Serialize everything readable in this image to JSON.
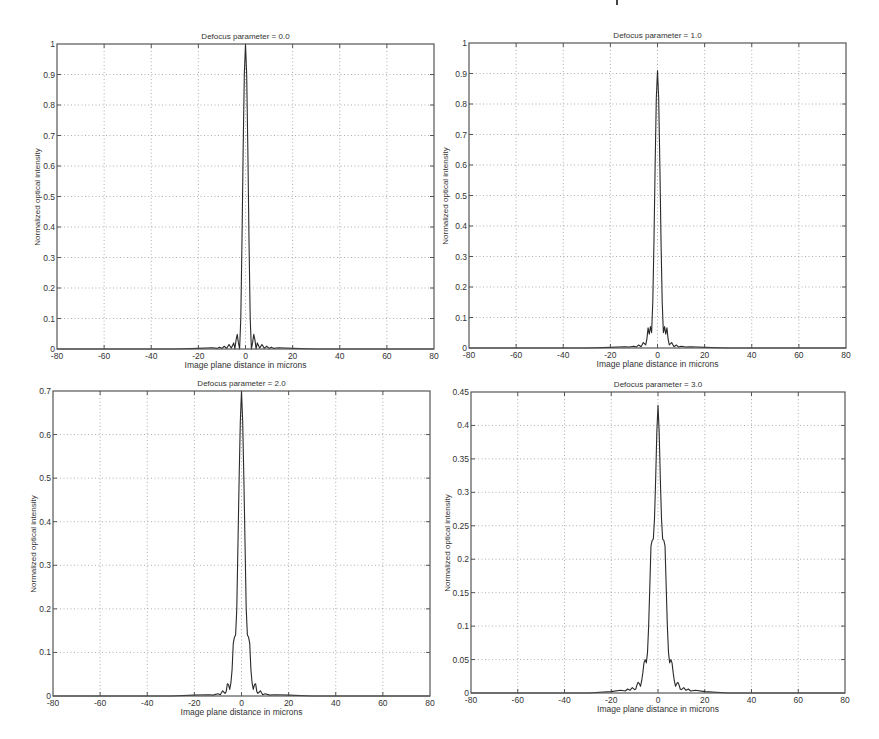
{
  "figure": {
    "background": "#ffffff",
    "line_color": "#2a2a2a",
    "grid_color": "#9a9a9a",
    "axes_color": "#555555"
  },
  "chart_data": [
    {
      "type": "line",
      "title": "Defocus parameter = 0.0",
      "xlabel": "Image plane distance in microns",
      "ylabel": "Normalized optical intensity",
      "xlim": [
        -80,
        80
      ],
      "ylim": [
        0,
        1
      ],
      "xticks": [
        "-80",
        "-60",
        "-40",
        "-20",
        "0",
        "20",
        "40",
        "60",
        "80"
      ],
      "yticks": [
        "0",
        "0.1",
        "0.2",
        "0.3",
        "0.4",
        "0.5",
        "0.6",
        "0.7",
        "0.8",
        "0.9",
        "1"
      ],
      "grid": true,
      "box": {
        "left": 57,
        "top": 44,
        "right": 434,
        "bottom": 349
      },
      "x": [
        -80,
        -30,
        -20,
        -14,
        -12,
        -11,
        -10,
        -9,
        -8,
        -7,
        -6,
        -5,
        -4.5,
        -4,
        -3.5,
        -3,
        -2.5,
        -2,
        -1.5,
        -1,
        -0.5,
        0,
        0.5,
        1,
        1.5,
        2,
        2.5,
        3,
        3.5,
        4,
        4.5,
        5,
        6,
        7,
        8,
        9,
        10,
        11,
        12,
        14,
        20,
        30,
        80
      ],
      "values": [
        0,
        0,
        0.002,
        0.004,
        0.002,
        0.006,
        0.002,
        0.009,
        0.002,
        0.015,
        0.003,
        0.02,
        0.0,
        0.03,
        0.048,
        0.02,
        0.0,
        0.1,
        0.35,
        0.65,
        0.9,
        1.0,
        0.9,
        0.65,
        0.35,
        0.1,
        0.0,
        0.02,
        0.048,
        0.03,
        0.0,
        0.02,
        0.003,
        0.015,
        0.002,
        0.009,
        0.002,
        0.006,
        0.002,
        0.004,
        0.002,
        0,
        0
      ]
    },
    {
      "type": "line",
      "title": "Defocus parameter = 1.0",
      "xlabel": "Image plane distance in microns",
      "ylabel": "Normalized optical intensity",
      "xlim": [
        -80,
        80
      ],
      "ylim": [
        0,
        1
      ],
      "xticks": [
        "-80",
        "-60",
        "-40",
        "-20",
        "0",
        "20",
        "40",
        "60",
        "80"
      ],
      "yticks": [
        "0",
        "0.1",
        "0.2",
        "0.3",
        "0.4",
        "0.5",
        "0.6",
        "0.7",
        "0.8",
        "0.9",
        "1"
      ],
      "grid": true,
      "box": {
        "left": 469,
        "top": 43,
        "right": 846,
        "bottom": 348
      },
      "x": [
        -80,
        -30,
        -20,
        -14,
        -12,
        -10,
        -9,
        -8,
        -7,
        -6,
        -5,
        -4.5,
        -4,
        -3.5,
        -3,
        -2.5,
        -2,
        -1.5,
        -1,
        -0.5,
        0,
        0.5,
        1,
        1.5,
        2,
        2.5,
        3,
        3.5,
        4,
        4.5,
        5,
        6,
        7,
        8,
        9,
        10,
        12,
        14,
        20,
        30,
        80
      ],
      "values": [
        0,
        0,
        0.002,
        0.004,
        0.003,
        0.006,
        0.003,
        0.01,
        0.004,
        0.018,
        0.01,
        0.03,
        0.066,
        0.045,
        0.07,
        0.05,
        0.15,
        0.35,
        0.6,
        0.82,
        0.91,
        0.82,
        0.6,
        0.35,
        0.15,
        0.05,
        0.07,
        0.045,
        0.066,
        0.03,
        0.01,
        0.018,
        0.004,
        0.01,
        0.003,
        0.006,
        0.003,
        0.004,
        0.002,
        0,
        0
      ]
    },
    {
      "type": "line",
      "title": "Defocus parameter = 2.0",
      "xlabel": "Image plane distance in microns",
      "ylabel": "Normalized optical intensity",
      "xlim": [
        -80,
        80
      ],
      "ylim": [
        0,
        0.7
      ],
      "xticks": [
        "-80",
        "-60",
        "-40",
        "-20",
        "0",
        "20",
        "40",
        "60",
        "80"
      ],
      "yticks": [
        "0",
        "0.1",
        "0.2",
        "0.3",
        "0.4",
        "0.5",
        "0.6",
        "0.7"
      ],
      "grid": true,
      "box": {
        "left": 53,
        "top": 391,
        "right": 430,
        "bottom": 696
      },
      "x": [
        -80,
        -30,
        -20,
        -14,
        -12,
        -10,
        -9,
        -8,
        -7,
        -6.5,
        -6,
        -5.5,
        -5,
        -4.5,
        -4,
        -3.5,
        -3,
        -2.5,
        -2,
        -1.5,
        -1,
        -0.5,
        0,
        0.5,
        1,
        1.5,
        2,
        2.5,
        3,
        3.5,
        4,
        4.5,
        5,
        5.5,
        6,
        6.5,
        7,
        8,
        9,
        10,
        12,
        14,
        20,
        30,
        80
      ],
      "values": [
        0,
        0,
        0.002,
        0.003,
        0.002,
        0.005,
        0.003,
        0.012,
        0.006,
        0.01,
        0.028,
        0.026,
        0.015,
        0.03,
        0.06,
        0.12,
        0.135,
        0.14,
        0.2,
        0.35,
        0.5,
        0.63,
        0.7,
        0.63,
        0.5,
        0.35,
        0.2,
        0.14,
        0.135,
        0.12,
        0.06,
        0.03,
        0.015,
        0.026,
        0.028,
        0.01,
        0.006,
        0.012,
        0.003,
        0.005,
        0.002,
        0.003,
        0.002,
        0,
        0
      ]
    },
    {
      "type": "line",
      "title": "Defocus parameter = 3.0",
      "xlabel": "Image plane distance in microns",
      "ylabel": "Normalized optical intensity",
      "xlim": [
        -80,
        80
      ],
      "ylim": [
        0,
        0.45
      ],
      "xticks": [
        "-80",
        "-60",
        "-40",
        "-20",
        "0",
        "20",
        "40",
        "60",
        "80"
      ],
      "yticks": [
        "0",
        "0.05",
        "0.1",
        "0.15",
        "0.2",
        "0.25",
        "0.3",
        "0.35",
        "0.4",
        "0.45"
      ],
      "grid": true,
      "box": {
        "left": 471,
        "top": 392,
        "right": 845,
        "bottom": 693
      },
      "x": [
        -80,
        -30,
        -20,
        -16,
        -14,
        -13,
        -12,
        -11,
        -10,
        -9.5,
        -9,
        -8.5,
        -8,
        -7.5,
        -7,
        -6.5,
        -6,
        -5.5,
        -5,
        -4.5,
        -4,
        -3.5,
        -3,
        -2.5,
        -2,
        -1.5,
        -1,
        -0.5,
        0,
        0.5,
        1,
        1.5,
        2,
        2.5,
        3,
        3.5,
        4,
        4.5,
        5,
        5.5,
        6,
        6.5,
        7,
        7.5,
        8,
        8.5,
        9,
        9.5,
        10,
        11,
        12,
        13,
        14,
        16,
        20,
        30,
        80
      ],
      "values": [
        0,
        0,
        0.002,
        0.004,
        0.003,
        0.006,
        0.004,
        0.008,
        0.005,
        0.006,
        0.012,
        0.016,
        0.014,
        0.01,
        0.018,
        0.03,
        0.045,
        0.05,
        0.045,
        0.06,
        0.1,
        0.16,
        0.22,
        0.228,
        0.23,
        0.26,
        0.32,
        0.39,
        0.43,
        0.39,
        0.32,
        0.26,
        0.23,
        0.228,
        0.22,
        0.16,
        0.1,
        0.06,
        0.045,
        0.05,
        0.045,
        0.03,
        0.018,
        0.01,
        0.014,
        0.016,
        0.012,
        0.006,
        0.005,
        0.008,
        0.004,
        0.006,
        0.003,
        0.004,
        0.002,
        0,
        0
      ]
    }
  ]
}
